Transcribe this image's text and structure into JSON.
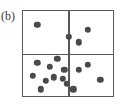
{
  "figure": {
    "panel_label": "(b)",
    "type": "point-pattern-diagram"
  },
  "colors": {
    "frame_stroke": "#585858",
    "divider_stroke": "#585858",
    "point_fill": "#4a4a4a",
    "background": "#ffffff",
    "label_text": "#3a3a3a"
  },
  "chart_data": {
    "type": "scatter",
    "title": "(b)",
    "xlabel": "",
    "ylabel": "",
    "xlim": [
      0,
      100
    ],
    "ylim": [
      0,
      100
    ],
    "grid": false,
    "legend": null,
    "quadrant_dividers": {
      "vertical_x": 50,
      "horizontal_y": 50
    },
    "quadrant_counts": {
      "top_left": 1,
      "top_right": 3,
      "bottom_left": 10,
      "bottom_right": 4
    },
    "total_points": 18,
    "point_radius_px": 3.2,
    "series": [
      {
        "name": "points",
        "points": [
          {
            "x": 16,
            "y": 84,
            "quadrant": "top_left"
          },
          {
            "x": 51,
            "y": 70,
            "quadrant": "top_right"
          },
          {
            "x": 72,
            "y": 78,
            "quadrant": "top_right"
          },
          {
            "x": 62,
            "y": 63,
            "quadrant": "top_right"
          },
          {
            "x": 16,
            "y": 39,
            "quadrant": "bottom_left"
          },
          {
            "x": 30,
            "y": 34,
            "quadrant": "bottom_left"
          },
          {
            "x": 38,
            "y": 44,
            "quadrant": "bottom_left"
          },
          {
            "x": 46,
            "y": 31,
            "quadrant": "bottom_left"
          },
          {
            "x": 11,
            "y": 24,
            "quadrant": "bottom_left"
          },
          {
            "x": 25,
            "y": 18,
            "quadrant": "bottom_left"
          },
          {
            "x": 34,
            "y": 22,
            "quadrant": "bottom_left"
          },
          {
            "x": 20,
            "y": 8,
            "quadrant": "bottom_left"
          },
          {
            "x": 44,
            "y": 20,
            "quadrant": "bottom_left"
          },
          {
            "x": 49,
            "y": 14,
            "quadrant": "bottom_left"
          },
          {
            "x": 62,
            "y": 31,
            "quadrant": "bottom_right"
          },
          {
            "x": 86,
            "y": 19,
            "quadrant": "bottom_right"
          },
          {
            "x": 56,
            "y": 8,
            "quadrant": "bottom_right"
          },
          {
            "x": 72,
            "y": 37,
            "quadrant": "bottom_right"
          }
        ]
      }
    ]
  }
}
